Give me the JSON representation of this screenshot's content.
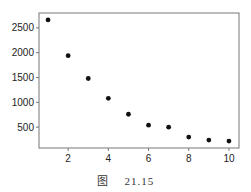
{
  "caption": {
    "prefix": "图",
    "number": "21.15"
  },
  "chart_data": {
    "type": "scatter",
    "title": "",
    "xlabel": "",
    "ylabel": "",
    "x": [
      1,
      2,
      3,
      4,
      5,
      6,
      7,
      8,
      9,
      10
    ],
    "y": [
      2660,
      1940,
      1480,
      1080,
      760,
      540,
      500,
      300,
      240,
      220
    ],
    "xticks": [
      2,
      4,
      6,
      8,
      10
    ],
    "yticks": [
      500,
      1000,
      1500,
      2000,
      2500
    ],
    "xlim": [
      0.55,
      10.5
    ],
    "ylim": [
      80,
      2800
    ],
    "grid": false,
    "legend": null,
    "marker_color": "#111111"
  }
}
